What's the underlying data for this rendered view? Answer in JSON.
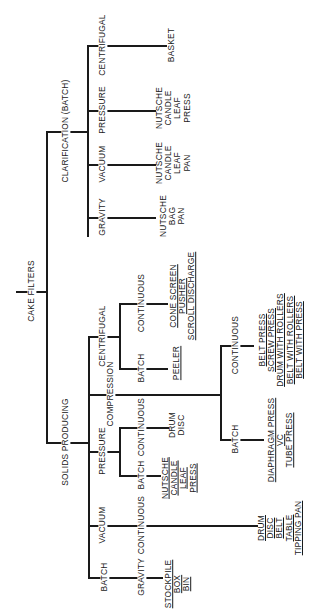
{
  "diagram": {
    "orientation": "rotated 90° counter-clockwise (text reads bottom-to-top)",
    "root": {
      "label": "CAKE FILTERS",
      "children": [
        {
          "label": "CLARIFICATION (BATCH)",
          "children": [
            {
              "label": "CENTRIFUGAL",
              "leaves": [
                "BASKET"
              ]
            },
            {
              "label": "PRESSURE",
              "leaves": [
                "NUTSCHE",
                "CANDLE",
                "LEAF",
                "PRESS"
              ]
            },
            {
              "label": "VACUUM",
              "leaves": [
                "NUTSCHE",
                "CANDLE",
                "LEAF",
                "PAN"
              ]
            },
            {
              "label": "GRAVITY",
              "leaves": [
                "NUTSCHE",
                "BAG",
                "PAN"
              ]
            }
          ]
        },
        {
          "label": "SOLIDS PRODUCING",
          "children": [
            {
              "label": "CENTRIFUGAL",
              "children": [
                {
                  "label": "CONTINUOUS",
                  "leaves": [
                    "CONE SCREEN",
                    "PUSHER",
                    "SCROLL DISCHARGE"
                  ]
                },
                {
                  "label": "BATCH",
                  "leaves": [
                    "PEELER"
                  ]
                }
              ]
            },
            {
              "label": "COMPRESSION",
              "children": [
                {
                  "label": "CONTINUOUS",
                  "leaves": [
                    "BELT PRESS",
                    "SCREW PRESS",
                    "DRUM WITH ROLLERS",
                    "BELT WITH ROLLERS",
                    "BELT WITH PRESS"
                  ]
                },
                {
                  "label": "BATCH",
                  "leaves": [
                    "DIAPHRAGM PRESS",
                    "VC",
                    "TUBE PRESS"
                  ]
                }
              ]
            },
            {
              "label": "PRESSURE",
              "children": [
                {
                  "label": "CONTINUOUS",
                  "leaves": [
                    "DRUM",
                    "DISC"
                  ]
                },
                {
                  "label": "BATCH",
                  "leaves": [
                    "NUTSCHE",
                    "CANDLE",
                    "LEAF",
                    "PRESS"
                  ]
                }
              ]
            },
            {
              "label": "VACUUM",
              "children": [
                {
                  "label": "CONTINUOUS",
                  "leaves": [
                    "DRUM",
                    "DISC",
                    "BELT",
                    "TABLE",
                    "TIPPING PAN"
                  ]
                }
              ]
            },
            {
              "label": "BATCH",
              "children": [
                {
                  "label": "GRAVITY",
                  "leaves": [
                    "STOCKPILE",
                    "BOX",
                    "BIN"
                  ]
                }
              ]
            }
          ]
        }
      ]
    },
    "labels": {
      "root": "CAKE FILTERS",
      "clar": "CLARIFICATION (BATCH)",
      "clar_centrifugal": "CENTRIFUGAL",
      "clar_pressure": "PRESSURE",
      "clar_vacuum": "VACUUM",
      "clar_gravity": "GRAVITY",
      "clar_centrifugal_leaves": "BASKET",
      "clar_pressure_leaves": "NUTSCHE\nCANDLE\nLEAF\nPRESS",
      "clar_vacuum_leaves": "NUTSCHE\nCANDLE\nLEAF\nPAN",
      "clar_gravity_leaves": "NUTSCHE\nBAG\nPAN",
      "solids": "SOLIDS PRODUCING",
      "sp_centrifugal": "CENTRIFUGAL",
      "sp_cent_continuous": "CONTINUOUS",
      "sp_cent_batch": "BATCH",
      "sp_cent_continuous_leaves": "CONE SCREEN\nPUSHER\nSCROLL DISCHARGE",
      "sp_cent_batch_leaves": "PEELER",
      "sp_compression": "COMPRESSION",
      "sp_comp_continuous": "CONTINUOUS",
      "sp_comp_batch": "BATCH",
      "sp_comp_continuous_leaves": "BELT PRESS\nSCREW PRESS\nDRUM WITH ROLLERS\nBELT WITH ROLLERS\nBELT WITH PRESS",
      "sp_comp_batch_leaves": "DIAPHRAGM PRESS\nVC\nTUBE PRESS",
      "sp_pressure": "PRESSURE",
      "sp_pres_continuous": "CONTINUOUS",
      "sp_pres_batch": "BATCH",
      "sp_pres_continuous_leaves": "DRUM\nDISC",
      "sp_pres_batch_leaves": "NUTSCHE\nCANDLE\nLEAF\nPRESS",
      "sp_vacuum": "VACUUM",
      "sp_vac_continuous": "CONTINUOUS",
      "sp_vac_continuous_leaves": "DRUM\nDISC\nBELT\nTABLE\nTIPPING PAN",
      "sp_batch": "BATCH",
      "sp_batch_gravity": "GRAVITY",
      "sp_batch_gravity_leaves": "STOCKPILE\nBOX\nBIN"
    }
  }
}
